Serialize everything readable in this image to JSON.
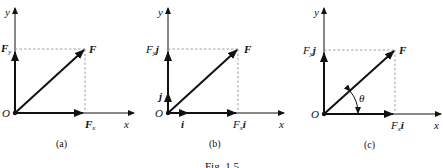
{
  "figure": {
    "caption": "Fig. 1.5",
    "colors": {
      "ink": "#111111",
      "dashed": "#888888",
      "background": "#ffffff"
    },
    "panels": [
      {
        "id": "a",
        "label": "(a)",
        "axis_x": "x",
        "axis_y": "y",
        "origin": "O",
        "vector": "F",
        "x_component": "F",
        "x_component_sub": "x",
        "y_component": "F",
        "y_component_sub": "y"
      },
      {
        "id": "b",
        "label": "(b)",
        "axis_x": "x",
        "axis_y": "y",
        "origin": "O",
        "vector": "F",
        "x_component": "F",
        "x_component_sub": "x",
        "x_component_unit": "i",
        "y_component": "F",
        "y_component_sub": "y",
        "y_component_unit": "j",
        "unit_i": "i",
        "unit_j": "j"
      },
      {
        "id": "c",
        "label": "(c)",
        "axis_x": "x",
        "axis_y": "y",
        "origin": "O",
        "vector": "F",
        "x_component": "F",
        "x_component_sub": "x",
        "x_component_unit": "i",
        "y_component": "F",
        "y_component_sub": "y",
        "y_component_unit": "j",
        "angle": "θ"
      }
    ]
  }
}
